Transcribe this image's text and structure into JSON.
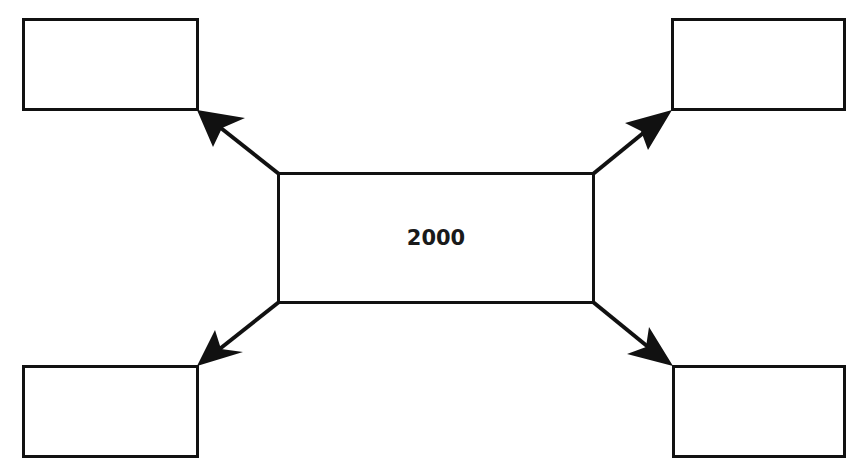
{
  "diagram": {
    "type": "hub-and-spoke",
    "center": {
      "label": "2000"
    },
    "outer_boxes": [
      {
        "position": "top-left",
        "label": ""
      },
      {
        "position": "top-right",
        "label": ""
      },
      {
        "position": "bottom-left",
        "label": ""
      },
      {
        "position": "bottom-right",
        "label": ""
      }
    ],
    "arrows": [
      {
        "from": "center",
        "to": "top-left"
      },
      {
        "from": "center",
        "to": "top-right"
      },
      {
        "from": "center",
        "to": "bottom-left"
      },
      {
        "from": "center",
        "to": "bottom-right"
      }
    ],
    "colors": {
      "stroke": "#111111",
      "background": "#ffffff"
    }
  }
}
